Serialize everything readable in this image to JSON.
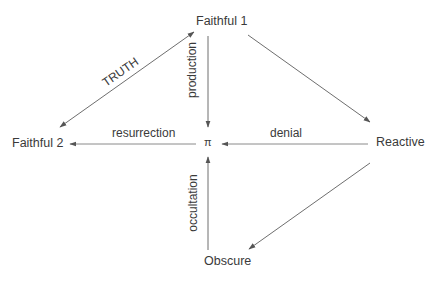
{
  "nodes": {
    "faithful1": "Faithful 1",
    "faithful2": "Faithful 2",
    "pi": "π",
    "reactive": "Reactive",
    "obscure": "Obscure"
  },
  "edges": {
    "truth": "TRUTH",
    "production": "production",
    "resurrection": "resurrection",
    "denial": "denial",
    "occultation": "occultation"
  },
  "colors": {
    "line": "#6e6e6e",
    "text": "#3a3a3a",
    "background": "#ffffff"
  }
}
